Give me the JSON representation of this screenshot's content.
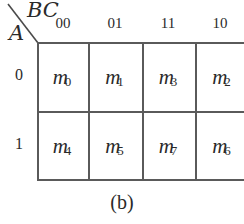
{
  "kmap": {
    "row_variable": "A",
    "column_variable": "BC",
    "column_headers": [
      "00",
      "01",
      "11",
      "10"
    ],
    "row_headers": [
      "0",
      "1"
    ],
    "cells": [
      [
        {
          "symbol": "m",
          "index": "0"
        },
        {
          "symbol": "m",
          "index": "1"
        },
        {
          "symbol": "m",
          "index": "3"
        },
        {
          "symbol": "m",
          "index": "2"
        }
      ],
      [
        {
          "symbol": "m",
          "index": "4"
        },
        {
          "symbol": "m",
          "index": "5"
        },
        {
          "symbol": "m",
          "index": "7"
        },
        {
          "symbol": "m",
          "index": "6"
        }
      ]
    ],
    "line_color": "#5a5a5a"
  },
  "caption": "(b)"
}
